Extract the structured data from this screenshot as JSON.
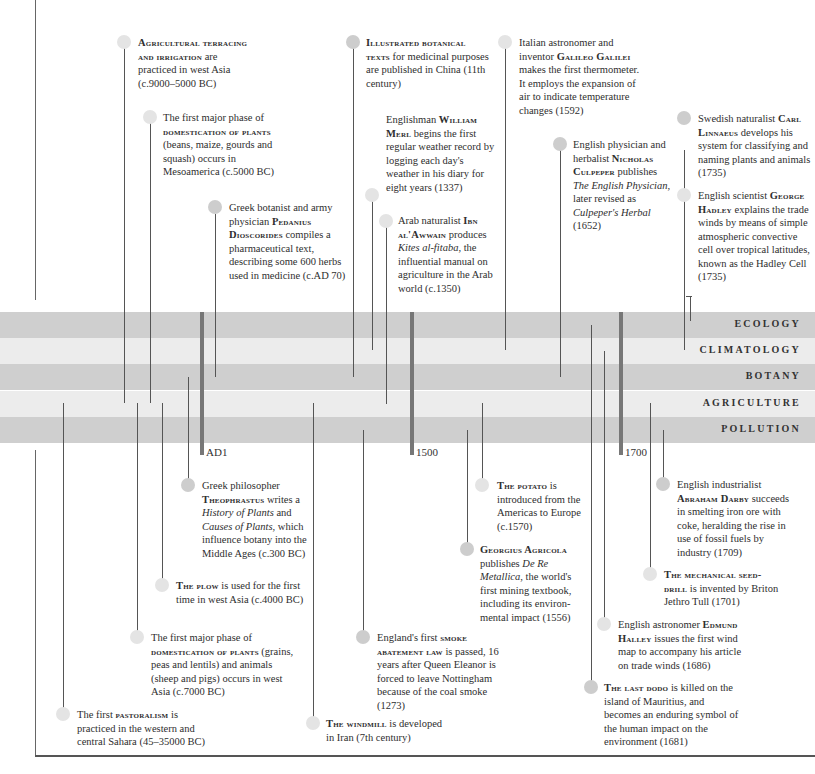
{
  "bands": [
    {
      "label": "ECOLOGY",
      "tone": "dark"
    },
    {
      "label": "CLIMATOLOGY",
      "tone": "light"
    },
    {
      "label": "BOTANY",
      "tone": "dark"
    },
    {
      "label": "AGRICULTURE",
      "tone": "light"
    },
    {
      "label": "POLLUTION",
      "tone": "dark"
    }
  ],
  "century_markers": [
    {
      "label": "AD1"
    },
    {
      "label": "1500"
    },
    {
      "label": "1700"
    }
  ],
  "colors": {
    "band_dark": "#cfcfcf",
    "band_light": "#ececec",
    "line": "#555555",
    "text": "#2e2e2e"
  },
  "events_above": [
    {
      "pre": "",
      "bold": "Agricultural terracing and irrigation",
      "post": " are practiced in west Asia (c.9000–5000 BC)",
      "category": "AGRICULTURE"
    },
    {
      "pre": "The first major phase of ",
      "bold": "domestication of plants",
      "post": " (beans, maize, gourds and squash) occurs in Mesoamerica (c.5000 BC)",
      "category": "AGRICULTURE"
    },
    {
      "pre": "Greek botanist and army physician ",
      "bold": "Pedanius Dioscorides",
      "post": " compiles a pharmaceutical text, describing some 600 herbs used in medicine (c.AD 70)",
      "category": "BOTANY"
    },
    {
      "pre": "",
      "bold": "Illustrated botanical texts",
      "post": " for medicinal purposes are published in China (11th century)",
      "category": "BOTANY"
    },
    {
      "pre": "Englishman ",
      "bold": "William Merl",
      "post": " begins the first regular weather record by logging each day's weather in his diary for eight years (1337)",
      "category": "CLIMATOLOGY"
    },
    {
      "pre": "Arab naturalist ",
      "bold": "Ibn al'Awwain",
      "post": " produces ",
      "italic": "Kites al-fitaba",
      "post2": ", the influential manual on agriculture in the Arab world (c.1350)",
      "category": "AGRICULTURE"
    },
    {
      "pre": "Italian astronomer and inventor ",
      "bold": "Galileo Galilei",
      "post": " makes the first thermometer. It employs the expansion of air to indicate temperature changes (1592)",
      "category": "CLIMATOLOGY"
    },
    {
      "pre": "English physician and herbalist ",
      "bold": "Nicholas Culpeper",
      "post": " publishes ",
      "italic": "The English Physician",
      "post2": ", later revised as ",
      "italic2": "Culpeper's Herbal",
      "post3": " (1652)",
      "category": "BOTANY"
    },
    {
      "pre": "Swedish naturalist ",
      "bold": "Carl Linnaeus",
      "post": " develops his system for classifying and naming plants and animals (1735)",
      "category": "ECOLOGY"
    },
    {
      "pre": "English scientist ",
      "bold": "George Hadley",
      "post": " explains the trade winds by means of simple atmospheric convective cell over tropical latitudes, known as the Hadley Cell (1735)",
      "category": "CLIMATOLOGY"
    }
  ],
  "events_below": [
    {
      "pre": "Greek philosopher ",
      "bold": "Theophrastus",
      "post": " writes a ",
      "italic": "History of Plants",
      "post2": " and ",
      "italic2": "Causes of Plants",
      "post3": ", which influence botany into the Middle Ages (c.300 BC)",
      "category": "BOTANY"
    },
    {
      "pre": "",
      "bold": "The plow",
      "post": " is used for the first time in west Asia (c.4000 BC)",
      "category": "AGRICULTURE"
    },
    {
      "pre": "The first major phase of ",
      "bold": "domestication of plants",
      "post": " (grains, peas and lentils) and animals (sheep and pigs) occurs in west Asia (c.7000 BC)",
      "category": "AGRICULTURE"
    },
    {
      "pre": "The first ",
      "bold": "pastoralism",
      "post": " is practiced in the western and central Sahara (45–35000 BC)",
      "category": "AGRICULTURE"
    },
    {
      "pre": "England's first ",
      "bold": "smoke abatement law",
      "post": " is passed, 16 years after Queen Eleanor is forced to leave Nottingham because of the coal smoke (1273)",
      "category": "POLLUTION"
    },
    {
      "pre": "",
      "bold": "The windmill",
      "post": " is developed in Iran (7th century)",
      "category": "AGRICULTURE"
    },
    {
      "pre": "",
      "bold": "The potato",
      "post": " is introduced from the Americas to Europe (c.1570)",
      "category": "AGRICULTURE"
    },
    {
      "pre": "",
      "bold": "Georgius Agricola",
      "post": " publishes ",
      "italic": "De Re Metallica",
      "post2": ", the world's first mining textbook, including its environ-mental impact (1556)",
      "category": "POLLUTION"
    },
    {
      "pre": "English industrialist ",
      "bold": "Abraham Darby",
      "post": " succeeds in smelting iron ore with coke, heralding the rise in use of fossil fuels by industry (1709)",
      "category": "POLLUTION"
    },
    {
      "pre": "",
      "bold": "The mechanical seed-drill",
      "post": " is invented by Briton Jethro Tull (1701)",
      "category": "AGRICULTURE"
    },
    {
      "pre": "English astronomer ",
      "bold": "Edmund Halley",
      "post": " issues the first wind map to accompany his article on trade winds (1686)",
      "category": "CLIMATOLOGY"
    },
    {
      "pre": "",
      "bold": "The last dodo",
      "post": " is killed on the island of Mauritius, and becomes an enduring symbol of the human impact on the environment (1681)",
      "category": "ECOLOGY"
    }
  ]
}
